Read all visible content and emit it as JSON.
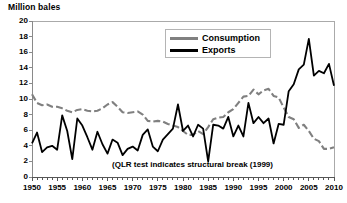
{
  "chart_data": {
    "type": "line",
    "title": "Million bales",
    "xlabel": "",
    "ylabel": "Million bales",
    "ylim": [
      0,
      20
    ],
    "xlim": [
      1950,
      2010
    ],
    "ytick_labels": [
      "20",
      "18",
      "16",
      "14",
      "12",
      "10",
      "8",
      "6",
      "4",
      "2",
      "0"
    ],
    "ytick_values": [
      20,
      18,
      16,
      14,
      12,
      10,
      8,
      6,
      4,
      2,
      0
    ],
    "xtick_labels": [
      "1950",
      "1955",
      "1960",
      "1965",
      "1970",
      "1975",
      "1980",
      "1985",
      "1990",
      "1995",
      "2000",
      "2005",
      "2010"
    ],
    "xtick_values": [
      1950,
      1955,
      1960,
      1965,
      1970,
      1975,
      1980,
      1985,
      1990,
      1995,
      2000,
      2005,
      2010
    ],
    "grid": false,
    "legend_position": "top-center",
    "annotations": [
      {
        "text": "(QLR test indicates structural break (1999)",
        "x": 1983,
        "y": 1.0
      }
    ],
    "x": [
      1950,
      1951,
      1952,
      1953,
      1954,
      1955,
      1956,
      1957,
      1958,
      1959,
      1960,
      1961,
      1962,
      1963,
      1964,
      1965,
      1966,
      1967,
      1968,
      1969,
      1970,
      1971,
      1972,
      1973,
      1974,
      1975,
      1976,
      1977,
      1978,
      1979,
      1980,
      1981,
      1982,
      1983,
      1984,
      1985,
      1986,
      1987,
      1988,
      1989,
      1990,
      1991,
      1992,
      1993,
      1994,
      1995,
      1996,
      1997,
      1998,
      1999,
      2000,
      2001,
      2002,
      2003,
      2004,
      2005,
      2006,
      2007,
      2008,
      2009,
      2010
    ],
    "series": [
      {
        "name": "Consumption",
        "color": "#808080",
        "style": "dashed",
        "values": [
          10.6,
          9.5,
          9.2,
          9.3,
          9.0,
          9.0,
          8.8,
          8.5,
          8.3,
          8.6,
          8.7,
          8.5,
          8.4,
          8.5,
          8.8,
          9.3,
          9.6,
          9.0,
          8.3,
          8.2,
          8.3,
          8.4,
          8.0,
          7.2,
          7.1,
          7.2,
          7.1,
          6.8,
          6.6,
          6.4,
          5.9,
          5.4,
          5.4,
          5.9,
          5.5,
          6.4,
          7.4,
          7.6,
          7.7,
          8.3,
          8.7,
          9.5,
          10.3,
          10.4,
          11.2,
          10.6,
          11.1,
          11.3,
          10.4,
          10.2,
          8.9,
          7.7,
          7.4,
          6.3,
          6.7,
          5.9,
          4.9,
          4.6,
          3.6,
          3.6,
          3.8
        ],
        "note": "Gray dashed line, declines sharply after 2000"
      },
      {
        "name": "Exports",
        "color": "#000000",
        "style": "solid",
        "values": [
          4.3,
          5.7,
          3.2,
          3.8,
          4.0,
          3.5,
          7.9,
          5.9,
          2.3,
          7.5,
          6.6,
          5.1,
          3.5,
          5.8,
          4.2,
          3.0,
          4.8,
          4.4,
          2.8,
          3.6,
          3.9,
          3.4,
          5.4,
          6.1,
          3.9,
          3.3,
          4.8,
          5.5,
          6.2,
          9.3,
          5.9,
          6.6,
          5.2,
          6.7,
          6.2,
          2.0,
          6.7,
          6.6,
          6.2,
          7.7,
          5.2,
          6.6,
          5.2,
          9.5,
          6.9,
          7.7,
          6.9,
          7.5,
          4.3,
          6.8,
          6.7,
          11.0,
          11.9,
          13.8,
          14.4,
          17.7,
          13.0,
          13.6,
          13.3,
          14.5,
          11.7
        ],
        "note": "Black solid line, peaks at 17.7 in 2005"
      }
    ]
  },
  "legend": {
    "items": [
      {
        "label": "Consumption",
        "color": "#808080"
      },
      {
        "label": "Exports",
        "color": "#000000"
      }
    ]
  }
}
